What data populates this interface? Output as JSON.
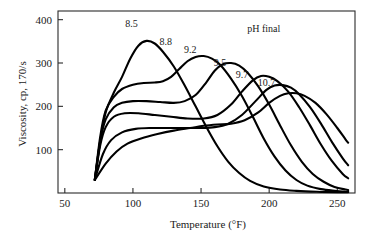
{
  "chart_data": {
    "type": "line",
    "title": "",
    "xlabel": "Temperature (°F)",
    "ylabel": "Viscosity, cp, 170/s",
    "xlim": [
      45,
      263
    ],
    "ylim": [
      0,
      420
    ],
    "xticks": [
      50,
      100,
      150,
      200,
      250
    ],
    "xtick_labels": [
      "50",
      "100",
      "150",
      "200",
      "250"
    ],
    "yticks": [
      100,
      200,
      300,
      400
    ],
    "ytick_labels": [
      "100",
      "200",
      "300",
      "400"
    ],
    "grid": false,
    "legend": "none",
    "annotations": [
      {
        "text": "pH final",
        "x": 196,
        "y": 372
      }
    ],
    "series": [
      {
        "name": "8.5",
        "label": "8.5",
        "label_x": 99,
        "label_y": 382,
        "points": [
          [
            72,
            30
          ],
          [
            76,
            120
          ],
          [
            80,
            186
          ],
          [
            86,
            232
          ],
          [
            92,
            268
          ],
          [
            98,
            310
          ],
          [
            104,
            340
          ],
          [
            110,
            351
          ],
          [
            116,
            345
          ],
          [
            122,
            326
          ],
          [
            130,
            292
          ],
          [
            138,
            248
          ],
          [
            146,
            200
          ],
          [
            154,
            152
          ],
          [
            162,
            108
          ],
          [
            170,
            72
          ],
          [
            178,
            46
          ],
          [
            186,
            28
          ],
          [
            196,
            15
          ],
          [
            208,
            8
          ],
          [
            220,
            5
          ],
          [
            235,
            3
          ],
          [
            250,
            2
          ],
          [
            258,
            2
          ]
        ]
      },
      {
        "name": "8.8",
        "label": "8.8",
        "label_x": 124,
        "label_y": 342,
        "points": [
          [
            72,
            30
          ],
          [
            76,
            130
          ],
          [
            80,
            190
          ],
          [
            86,
            222
          ],
          [
            92,
            240
          ],
          [
            100,
            250
          ],
          [
            108,
            254
          ],
          [
            116,
            255
          ],
          [
            122,
            258
          ],
          [
            128,
            268
          ],
          [
            134,
            286
          ],
          [
            140,
            304
          ],
          [
            146,
            314
          ],
          [
            152,
            316
          ],
          [
            158,
            310
          ],
          [
            164,
            296
          ],
          [
            172,
            264
          ],
          [
            180,
            224
          ],
          [
            188,
            176
          ],
          [
            196,
            126
          ],
          [
            204,
            84
          ],
          [
            212,
            52
          ],
          [
            220,
            30
          ],
          [
            228,
            17
          ],
          [
            238,
            9
          ],
          [
            248,
            5
          ],
          [
            256,
            3
          ],
          [
            258,
            3
          ]
        ]
      },
      {
        "name": "9.2",
        "label": "9.2",
        "label_x": 142,
        "label_y": 322,
        "points": [
          [
            72,
            30
          ],
          [
            76,
            120
          ],
          [
            80,
            170
          ],
          [
            86,
            198
          ],
          [
            92,
            208
          ],
          [
            100,
            212
          ],
          [
            110,
            212
          ],
          [
            120,
            210
          ],
          [
            130,
            208
          ],
          [
            138,
            212
          ],
          [
            146,
            226
          ],
          [
            154,
            256
          ],
          [
            160,
            282
          ],
          [
            166,
            297
          ],
          [
            172,
            300
          ],
          [
            178,
            294
          ],
          [
            184,
            278
          ],
          [
            192,
            246
          ],
          [
            200,
            204
          ],
          [
            208,
            156
          ],
          [
            216,
            110
          ],
          [
            224,
            72
          ],
          [
            232,
            44
          ],
          [
            240,
            26
          ],
          [
            248,
            14
          ],
          [
            256,
            8
          ],
          [
            258,
            7
          ]
        ]
      },
      {
        "name": "9.5",
        "label": "9.5",
        "label_x": 164,
        "label_y": 293,
        "points": [
          [
            72,
            30
          ],
          [
            76,
            110
          ],
          [
            80,
            152
          ],
          [
            86,
            176
          ],
          [
            94,
            184
          ],
          [
            104,
            184
          ],
          [
            116,
            180
          ],
          [
            128,
            176
          ],
          [
            140,
            172
          ],
          [
            152,
            172
          ],
          [
            162,
            180
          ],
          [
            172,
            204
          ],
          [
            180,
            234
          ],
          [
            188,
            260
          ],
          [
            194,
            270
          ],
          [
            200,
            268
          ],
          [
            206,
            258
          ],
          [
            214,
            234
          ],
          [
            222,
            198
          ],
          [
            230,
            156
          ],
          [
            238,
            112
          ],
          [
            246,
            74
          ],
          [
            254,
            44
          ],
          [
            258,
            34
          ]
        ]
      },
      {
        "name": "9.7",
        "label": "9.7",
        "label_x": 180,
        "label_y": 265,
        "points": [
          [
            72,
            30
          ],
          [
            78,
            90
          ],
          [
            84,
            122
          ],
          [
            92,
            140
          ],
          [
            102,
            148
          ],
          [
            114,
            150
          ],
          [
            126,
            150
          ],
          [
            138,
            150
          ],
          [
            150,
            150
          ],
          [
            160,
            152
          ],
          [
            170,
            160
          ],
          [
            180,
            180
          ],
          [
            190,
            212
          ],
          [
            198,
            238
          ],
          [
            204,
            248
          ],
          [
            210,
            249
          ],
          [
            216,
            243
          ],
          [
            222,
            228
          ],
          [
            230,
            198
          ],
          [
            238,
            160
          ],
          [
            246,
            118
          ],
          [
            254,
            80
          ],
          [
            258,
            64
          ]
        ]
      },
      {
        "name": "10.7",
        "label": "10.7",
        "label_x": 198,
        "label_y": 248,
        "points": [
          [
            72,
            30
          ],
          [
            80,
            68
          ],
          [
            88,
            96
          ],
          [
            96,
            114
          ],
          [
            106,
            126
          ],
          [
            118,
            136
          ],
          [
            130,
            144
          ],
          [
            142,
            150
          ],
          [
            152,
            155
          ],
          [
            162,
            158
          ],
          [
            172,
            160
          ],
          [
            182,
            168
          ],
          [
            192,
            186
          ],
          [
            200,
            208
          ],
          [
            208,
            224
          ],
          [
            214,
            230
          ],
          [
            220,
            230
          ],
          [
            226,
            224
          ],
          [
            234,
            208
          ],
          [
            242,
            182
          ],
          [
            250,
            150
          ],
          [
            256,
            124
          ],
          [
            258,
            116
          ]
        ]
      }
    ]
  }
}
